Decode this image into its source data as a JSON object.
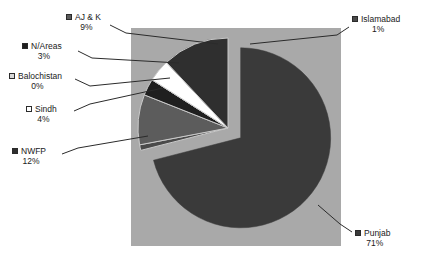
{
  "chart_data": {
    "type": "pie",
    "title": "",
    "subtitle": "",
    "xlabel": "",
    "ylabel": "",
    "legend_position": "callout-labels",
    "grid": false,
    "exploded_slice": "Punjab",
    "categories": [
      "Punjab",
      "NWFP",
      "AJ & K",
      "Sindh",
      "N/Areas",
      "Islamabad",
      "Balochistan"
    ],
    "values": [
      71,
      12,
      9,
      4,
      3,
      1,
      0
    ],
    "labels": [
      {
        "name": "Punjab",
        "percent": "71%",
        "value": 71,
        "swatch": "#3a3a3a"
      },
      {
        "name": "NWFP",
        "percent": "12%",
        "value": 12,
        "swatch": "#2f2f2f"
      },
      {
        "name": "AJ & K",
        "percent": "9%",
        "value": 9,
        "swatch": "#5c5c5c"
      },
      {
        "name": "Sindh",
        "percent": "4%",
        "value": 4,
        "swatch": "#ffffff"
      },
      {
        "name": "N/Areas",
        "percent": "3%",
        "value": 3,
        "swatch": "#1f1f1f"
      },
      {
        "name": "Islamabad",
        "percent": "1%",
        "value": 1,
        "swatch": "#4a4a4a"
      },
      {
        "name": "Balochistan",
        "percent": "0%",
        "value": 0,
        "swatch": "#d8d8d8"
      }
    ],
    "colors": {
      "plot_background": "#a9a9a9",
      "page_background": "#ffffff",
      "punjab": "#3a3a3a",
      "nwfp": "#2f2f2f",
      "ajk": "#5c5c5c",
      "sindh": "#ffffff",
      "nareas": "#1f1f1f",
      "islamabad": "#4a4a4a",
      "balochistan": "#d8d8d8",
      "leader_line": "#2b2b2b",
      "text": "#1a1a1a"
    }
  }
}
